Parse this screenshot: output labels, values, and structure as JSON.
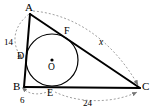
{
  "figure": {
    "colors": {
      "stroke": "#000000",
      "dashed": "#777777",
      "background": "#ffffff",
      "circle": "#000000"
    },
    "vertices": [
      {
        "name": "A",
        "label": "A",
        "x": 30,
        "y": 14,
        "label_x": 25,
        "label_y": 2
      },
      {
        "name": "B",
        "label": "B",
        "x": 24,
        "y": 87,
        "label_x": 13,
        "label_y": 82
      },
      {
        "name": "C",
        "label": "C",
        "x": 140,
        "y": 88,
        "label_x": 142,
        "label_y": 82
      }
    ],
    "tangent_points": [
      {
        "name": "D",
        "label": "D",
        "x": 27,
        "y": 57,
        "label_x": 17,
        "label_y": 51,
        "on_segment": "AB"
      },
      {
        "name": "E",
        "label": "E",
        "x": 52,
        "y": 87,
        "label_x": 47,
        "label_y": 88,
        "on_segment": "BC"
      },
      {
        "name": "F",
        "label": "F",
        "x": 70,
        "y": 35,
        "label_x": 64,
        "label_y": 26,
        "on_segment": "AC"
      }
    ],
    "incircle": {
      "center_name": "O",
      "center_label": "O",
      "center_x": 52,
      "center_y": 60,
      "radius": 26,
      "label_x": 48,
      "label_y": 63,
      "center_dot_radius": 1.6
    },
    "measures": [
      {
        "name": "AD",
        "label": "14",
        "label_x": 4,
        "label_y": 38,
        "italic": false
      },
      {
        "name": "BE",
        "label": "6",
        "label_x": 20,
        "label_y": 97,
        "italic": false
      },
      {
        "name": "EC",
        "label": "24",
        "label_x": 83,
        "label_y": 99,
        "italic": false
      },
      {
        "name": "FC",
        "label": "x",
        "label_x": 99,
        "label_y": 38,
        "italic": true
      }
    ]
  }
}
